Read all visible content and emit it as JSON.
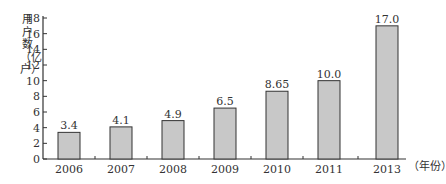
{
  "chart_data": {
    "type": "bar",
    "title": "",
    "xlabel": "（年份）",
    "ylabel": "用户数（亿户）",
    "categories": [
      "2006",
      "2007",
      "2008",
      "2009",
      "2010",
      "2011",
      "2013"
    ],
    "values": [
      3.4,
      4.1,
      4.9,
      6.5,
      8.65,
      10.0,
      17.0
    ],
    "value_labels": [
      "3.4",
      "4.1",
      "4.9",
      "6.5",
      "8.65",
      "10.0",
      "17.0"
    ],
    "yticks": [
      0,
      2,
      4,
      6,
      8,
      10,
      12,
      14,
      16,
      18
    ],
    "ylim": [
      0,
      18
    ],
    "grid": false,
    "legend": null,
    "colors": {
      "bar_fill": "#c8c8c8",
      "bar_stroke": "#333333",
      "axis": "#333333"
    }
  },
  "labels": {
    "ylabel_vertical": "用户数（亿户）",
    "x_unit": "（年份）"
  }
}
